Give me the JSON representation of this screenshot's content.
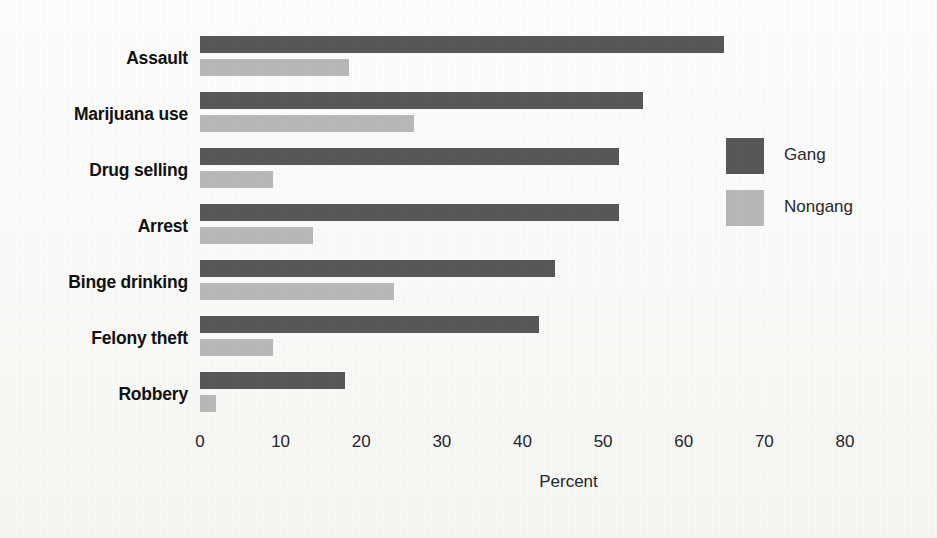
{
  "chart_data": {
    "type": "bar",
    "orientation": "horizontal",
    "title": "",
    "xlabel": "Percent",
    "ylabel": "",
    "xlim": [
      0,
      80
    ],
    "xticks": [
      0,
      10,
      20,
      30,
      40,
      50,
      60,
      70,
      80
    ],
    "xtick_labels": [
      "0",
      "10",
      "20",
      "30",
      "40",
      "50",
      "60",
      "70",
      "80"
    ],
    "grid": false,
    "legend_position": "right",
    "categories": [
      "Assault",
      "Marijuana use",
      "Drug selling",
      "Arrest",
      "Binge drinking",
      "Felony theft",
      "Robbery"
    ],
    "series": [
      {
        "name": "Gang",
        "color": "#58585a",
        "values": [
          65,
          55,
          52,
          52,
          44,
          42,
          18
        ]
      },
      {
        "name": "Nongang",
        "color": "#b9b9b9",
        "values": [
          18.5,
          26.5,
          9,
          14,
          24,
          9,
          2
        ]
      }
    ]
  },
  "legend": {
    "items": [
      {
        "label": "Gang",
        "color": "#58585a"
      },
      {
        "label": "Nongang",
        "color": "#b9b9b9"
      }
    ]
  }
}
